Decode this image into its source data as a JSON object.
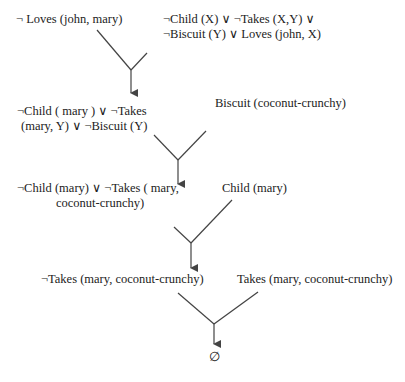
{
  "diagram": {
    "nodes": {
      "n1": {
        "lines": [
          "¬ Loves (john, mary)"
        ]
      },
      "n2": {
        "lines": [
          "¬Child (X) ∨ ¬Takes (X,Y) ∨",
          "¬Biscuit (Y) ∨ Loves (john, X)"
        ]
      },
      "n3": {
        "lines": [
          "¬Child ( mary ) ∨ ¬Takes",
          "(mary, Y) ∨ ¬Biscuit (Y)"
        ]
      },
      "n4": {
        "lines": [
          "Biscuit (coconut-crunchy)"
        ]
      },
      "n5": {
        "lines": [
          "¬Child (mary)  ∨ ¬Takes  ( mary,",
          "coconut-crunchy)"
        ]
      },
      "n6": {
        "lines": [
          "Child (mary)"
        ]
      },
      "n7": {
        "lines": [
          "¬Takes (mary, coconut-crunchy)"
        ]
      },
      "n8": {
        "lines": [
          "Takes (mary, coconut-crunchy)"
        ]
      },
      "n9": {
        "lines": [
          "∅"
        ]
      }
    },
    "edges": [
      {
        "from": "n1",
        "to": "n3"
      },
      {
        "from": "n2",
        "to": "n3"
      },
      {
        "from": "n3",
        "to": "n5"
      },
      {
        "from": "n4",
        "to": "n5"
      },
      {
        "from": "n5",
        "to": "n7"
      },
      {
        "from": "n6",
        "to": "n7"
      },
      {
        "from": "n7",
        "to": "n9"
      },
      {
        "from": "n8",
        "to": "n9"
      }
    ],
    "line_color": "#444444"
  }
}
